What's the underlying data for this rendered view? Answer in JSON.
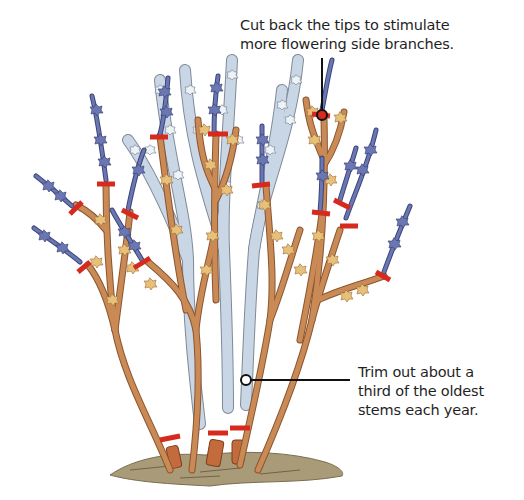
{
  "diagram": {
    "type": "illustration",
    "colors": {
      "new_growth_stem": "#c98a55",
      "new_growth_leaf": "#e7c07a",
      "old_stem": "#c8d6e6",
      "pruned_tip": "#5b6aa8",
      "cut_mark": "#d62a1e",
      "soil": "#a99a78",
      "callout_line": "#111111"
    },
    "callouts": [
      {
        "id": "tip-pruning",
        "lines": [
          "Cut back the tips to stimulate",
          "more flowering side branches."
        ],
        "anchor": [
          322,
          115
        ]
      },
      {
        "id": "stem-removal",
        "lines": [
          "Trim out about a",
          "third of the oldest",
          "stems each year."
        ],
        "anchor": [
          246,
          380
        ]
      }
    ]
  }
}
